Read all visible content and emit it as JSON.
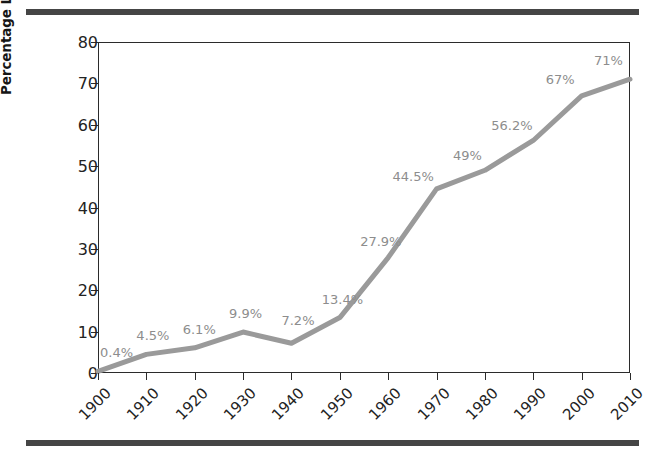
{
  "chart_data": {
    "type": "line",
    "title": "",
    "xlabel": "",
    "ylabel": "Percentage Living in Urban Areas",
    "categories": [
      "1900",
      "1910",
      "1920",
      "1930",
      "1940",
      "1950",
      "1960",
      "1970",
      "1980",
      "1990",
      "2000",
      "2010"
    ],
    "values": [
      0.4,
      4.5,
      6.1,
      9.9,
      7.2,
      13.4,
      27.9,
      44.5,
      49,
      56.2,
      67,
      71
    ],
    "point_labels": [
      "0.4%",
      "4.5%",
      "6.1%",
      "9.9%",
      "7.2%",
      "13.4%",
      "27.9%",
      "44.5%",
      "49%",
      "56.2%",
      "67%",
      "71%"
    ],
    "ylim": [
      0,
      80
    ],
    "y_ticks": [
      0,
      10,
      20,
      30,
      40,
      50,
      60,
      70,
      80
    ],
    "y_tick_labels": [
      "0",
      "10",
      "20",
      "30",
      "40",
      "50",
      "60",
      "70",
      "80"
    ],
    "grid": false,
    "legend": "none",
    "series_color": "#9a9a9a",
    "label_color": "#8d8d8d",
    "axis_color": "#2b2b2b",
    "rule_color": "#454545",
    "background": "#ffffff"
  },
  "figure": {
    "y_axis_title": "Percentage Living in Urban Areas",
    "top_rule": "page-rule",
    "bottom_rule": "page-rule"
  }
}
